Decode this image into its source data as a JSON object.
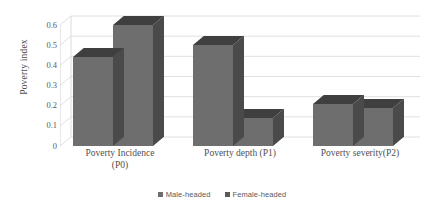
{
  "chart_data": {
    "type": "bar",
    "title": "",
    "xlabel": "",
    "ylabel": "Poverty index",
    "ylim": [
      0,
      0.6
    ],
    "ytick_labels": [
      "0.6",
      "0.5",
      "0.4",
      "0.3",
      "0.2",
      "0.1",
      "0"
    ],
    "ytick_values": [
      0.6,
      0.5,
      0.4,
      0.3,
      0.2,
      0.1,
      0
    ],
    "grid": true,
    "three_d": true,
    "legend_position": "bottom",
    "categories": [
      "Poverty Incidence (P0)",
      "Poverty depth (P1)",
      "Poverty severity(P2)"
    ],
    "category_lines": [
      [
        "Poverty Incidence",
        "(P0)"
      ],
      [
        "Poverty depth (P1)",
        ""
      ],
      [
        "Poverty severity(P2)",
        ""
      ]
    ],
    "series": [
      {
        "name": "Male-headed",
        "color": "#6e6e6e",
        "values": [
          0.44,
          0.5,
          0.21
        ]
      },
      {
        "name": "Female-headed",
        "color": "#6e6e6e",
        "values": [
          0.6,
          0.14,
          0.19
        ]
      }
    ]
  },
  "legend": {
    "items": [
      {
        "label": "Male-headed",
        "color": "#6e6e6e"
      },
      {
        "label": "Female-headed",
        "color": "#5a5a5a"
      }
    ]
  },
  "colors": {
    "bar_front": "#6e6e6e",
    "bar_top": "#3f3f3f",
    "bar_side": "#4a4a4a",
    "gridline": "#d8d8d8",
    "text": "#4f4f4f",
    "background": "#ffffff"
  }
}
